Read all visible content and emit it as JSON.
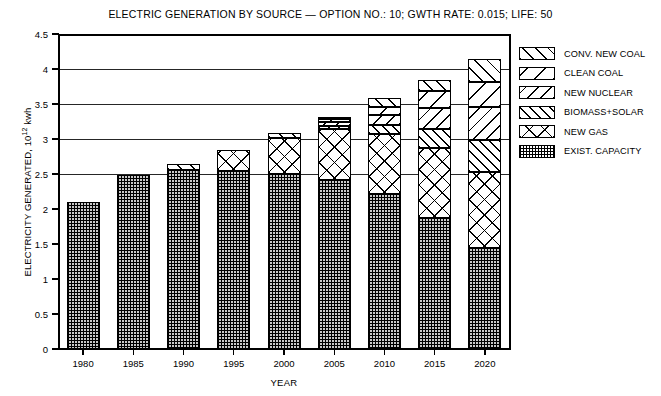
{
  "chart_data": {
    "type": "bar",
    "stacked": true,
    "title": "ELECTRIC GENERATION BY SOURCE — OPTION NO.: 10; GWTH RATE: 0.015; LIFE: 50",
    "xlabel": "YEAR",
    "ylabel": "ELECTRICITY GENERATED, 10",
    "ylabel_exponent": "12",
    "ylabel_unit": " kwh",
    "categories": [
      "1980",
      "1985",
      "1990",
      "1995",
      "2000",
      "2005",
      "2010",
      "2015",
      "2020"
    ],
    "ylim": [
      0,
      4.5
    ],
    "yticks": [
      "0",
      "0.5",
      "1",
      "1.5",
      "2",
      "2.5",
      "3",
      "3.5",
      "4",
      "4.5"
    ],
    "ytick_values": [
      0,
      0.5,
      1,
      1.5,
      2,
      2.5,
      3,
      3.5,
      4,
      4.5
    ],
    "grid": "horizontal",
    "legend_position": "right",
    "series": [
      {
        "name": "EXIST. CAPACITY",
        "pattern": "stipple",
        "values": [
          2.1,
          2.48,
          2.56,
          2.55,
          2.5,
          2.42,
          2.22,
          1.87,
          1.45
        ]
      },
      {
        "name": "NEW GAS",
        "pattern": "crosshatch",
        "values": [
          0.0,
          0.0,
          0.0,
          0.3,
          0.52,
          0.72,
          0.85,
          1.0,
          1.08
        ]
      },
      {
        "name": "BIOMASS+SOLAR",
        "pattern": "fine-diagonal-up",
        "values": [
          0.0,
          0.0,
          0.0,
          0.0,
          0.0,
          0.05,
          0.13,
          0.28,
          0.45
        ]
      },
      {
        "name": "NEW NUCLEAR",
        "pattern": "diagonal-down",
        "values": [
          0.0,
          0.0,
          0.0,
          0.0,
          0.0,
          0.05,
          0.14,
          0.3,
          0.48
        ]
      },
      {
        "name": "CLEAN COAL",
        "pattern": "wide-diagonal-down",
        "values": [
          0.0,
          0.0,
          0.0,
          0.0,
          0.0,
          0.04,
          0.12,
          0.24,
          0.36
        ]
      },
      {
        "name": "CONV. NEW COAL",
        "pattern": "diagonal-up",
        "values": [
          0.0,
          0.0,
          0.09,
          0.0,
          0.06,
          0.04,
          0.12,
          0.16,
          0.33
        ]
      }
    ],
    "totals": [
      2.1,
      2.48,
      2.65,
      2.85,
      3.08,
      3.32,
      3.58,
      3.85,
      4.15
    ]
  },
  "legend": {
    "items": [
      {
        "label": "CONV. NEW COAL",
        "pattern_class": "pat-conv"
      },
      {
        "label": "CLEAN COAL",
        "pattern_class": "pat-clean"
      },
      {
        "label": "NEW NUCLEAR",
        "pattern_class": "pat-nuclear"
      },
      {
        "label": "BIOMASS+SOLAR",
        "pattern_class": "pat-biomass"
      },
      {
        "label": "NEW GAS",
        "pattern_class": "pat-gas"
      },
      {
        "label": "EXIST. CAPACITY",
        "pattern_class": "pat-exist"
      }
    ]
  },
  "colors": {
    "ink": "#000000",
    "paper": "#ffffff",
    "exist_capacity_fill": "#c9c9c9"
  }
}
